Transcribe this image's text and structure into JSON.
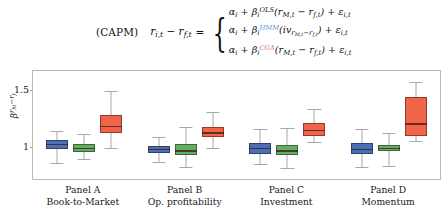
{
  "equation": {
    "label": "(CAPM)",
    "lhs": "r_{i,t} - r_{f,t}",
    "equals": "=",
    "cases": [
      {
        "id": "ols",
        "alpha": "α",
        "alpha_sub": "i",
        "beta": "β",
        "beta_sub": "i",
        "beta_sup": "OLS",
        "sup_color": "#1a1a1a",
        "term": "(r_{M,t} - r_{f,t})",
        "error": "ε_{i,t}"
      },
      {
        "id": "mid",
        "alpha": "α",
        "alpha_sub": "i",
        "beta": "β",
        "beta_sub": "i",
        "beta_sup": "HMM",
        "sup_color": "#5b9bd5",
        "term": "(iv_{r_{M,t}-r_{f,t}})",
        "error": "ε_{i,t}"
      },
      {
        "id": "cga",
        "alpha": "α",
        "alpha_sub": "i",
        "beta": "β",
        "beta_sub": "i",
        "beta_sup": "CGA",
        "sup_color": "#e8705a",
        "term": "(r_{M,t} - r_{f,t})",
        "error": "ε_{i,t}"
      }
    ]
  },
  "chart_data": {
    "type": "box",
    "title": "",
    "xlabel": "",
    "ylabel": "β^{r_M - r_f}",
    "ylim": [
      0.72,
      1.68
    ],
    "yticks": [
      1,
      1.5
    ],
    "ytick_labels": [
      "1",
      "1.5"
    ],
    "grid": false,
    "legend": null,
    "series": [
      {
        "name": "OLS",
        "color": "#4a6fb5"
      },
      {
        "name": "HMM",
        "color": "#63ae63"
      },
      {
        "name": "CGA",
        "color": "#f0654a"
      }
    ],
    "panels": [
      {
        "id": "A",
        "label": "Panel A",
        "sublabel": "Book-to-Market",
        "boxes": [
          {
            "series": "OLS",
            "color": "#4a6fb5",
            "whisker_low": 0.865,
            "q1": 0.985,
            "median": 1.03,
            "q3": 1.065,
            "whisker_high": 1.15
          },
          {
            "series": "HMM",
            "color": "#63ae63",
            "whisker_low": 0.895,
            "q1": 0.96,
            "median": 0.995,
            "q3": 1.03,
            "whisker_high": 1.12
          },
          {
            "series": "CGA",
            "color": "#f0654a",
            "whisker_low": 1.0,
            "q1": 1.125,
            "median": 1.19,
            "q3": 1.285,
            "whisker_high": 1.505
          }
        ]
      },
      {
        "id": "B",
        "label": "Panel B",
        "sublabel": "Op. profitability",
        "boxes": [
          {
            "series": "OLS",
            "color": "#4a6fb5",
            "whisker_low": 0.87,
            "q1": 0.955,
            "median": 0.985,
            "q3": 1.015,
            "whisker_high": 1.095
          },
          {
            "series": "HMM",
            "color": "#63ae63",
            "whisker_low": 0.83,
            "q1": 0.93,
            "median": 0.975,
            "q3": 1.03,
            "whisker_high": 1.185
          },
          {
            "series": "CGA",
            "color": "#f0654a",
            "whisker_low": 0.995,
            "q1": 1.095,
            "median": 1.135,
            "q3": 1.18,
            "whisker_high": 1.32
          }
        ]
      },
      {
        "id": "C",
        "label": "Panel C",
        "sublabel": "Investment",
        "boxes": [
          {
            "series": "OLS",
            "color": "#4a6fb5",
            "whisker_low": 0.855,
            "q1": 0.945,
            "median": 0.995,
            "q3": 1.04,
            "whisker_high": 1.165
          },
          {
            "series": "HMM",
            "color": "#63ae63",
            "whisker_low": 0.815,
            "q1": 0.93,
            "median": 0.975,
            "q3": 1.02,
            "whisker_high": 1.17
          },
          {
            "series": "CGA",
            "color": "#f0654a",
            "whisker_low": 1.05,
            "q1": 1.105,
            "median": 1.16,
            "q3": 1.22,
            "whisker_high": 1.345
          }
        ]
      },
      {
        "id": "D",
        "label": "Panel D",
        "sublabel": "Momentum",
        "boxes": [
          {
            "series": "OLS",
            "color": "#4a6fb5",
            "whisker_low": 0.83,
            "q1": 0.94,
            "median": 0.99,
            "q3": 1.04,
            "whisker_high": 1.165
          },
          {
            "series": "HMM",
            "color": "#63ae63",
            "whisker_low": 0.84,
            "q1": 0.965,
            "median": 0.995,
            "q3": 1.025,
            "whisker_high": 1.125
          },
          {
            "series": "CGA",
            "color": "#f0654a",
            "whisker_low": 1.06,
            "q1": 1.1,
            "median": 1.215,
            "q3": 1.45,
            "whisker_high": 1.58
          }
        ]
      }
    ]
  }
}
